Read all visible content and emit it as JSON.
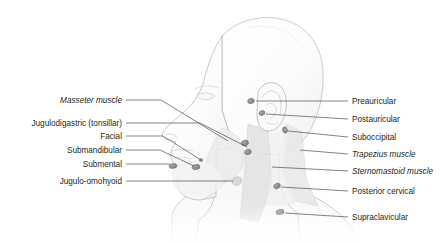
{
  "figure": {
    "background_color": "#ffffff",
    "outline_color": "#a8a8a8",
    "skin_fill": "#fbfbfb",
    "shade_fill": "#ececec",
    "muscle_fill": "#e2e2e2",
    "node_fill": "#8c8c8c",
    "leader_color": "#4d4d4d",
    "text_color": "#231f20"
  },
  "labels_left": [
    {
      "text": "Masseter muscle",
      "style": "italic",
      "x_right": 122,
      "y": 101,
      "leader": {
        "x1": 126,
        "y1": 100,
        "x2": 161,
        "y2": 100,
        "x3": 228,
        "y3": 141
      }
    },
    {
      "text": "Jugulodigastric (tonsillar)",
      "style": "normal",
      "x_right": 122,
      "y": 124,
      "leader": {
        "x1": 126,
        "y1": 123,
        "x2": 200,
        "y2": 123,
        "x3": 247,
        "y3": 105
      }
    },
    {
      "text": "Facial",
      "style": "normal",
      "x_right": 122,
      "y": 137,
      "leader": {
        "x1": 126,
        "y1": 136,
        "x2": 163,
        "y2": 136,
        "x3": 201,
        "y3": 160
      }
    },
    {
      "text": "Submandibular",
      "style": "normal",
      "x_right": 122,
      "y": 151,
      "leader": {
        "x1": 126,
        "y1": 150,
        "x2": 160,
        "y2": 150,
        "x3": 196,
        "y3": 165
      }
    },
    {
      "text": "Submental",
      "style": "normal",
      "x_right": 122,
      "y": 165,
      "leader": {
        "x1": 126,
        "y1": 164,
        "x2": 176,
        "y2": 164,
        "x3": 176,
        "y3": 164
      }
    },
    {
      "text": "Jugulo-omohyoid",
      "style": "normal",
      "x_right": 122,
      "y": 182,
      "leader": {
        "x1": 126,
        "y1": 181,
        "x2": 236,
        "y2": 181,
        "x3": 236,
        "y3": 181
      }
    }
  ],
  "labels_right": [
    {
      "text": "Preauricular",
      "style": "normal",
      "x_left": 352,
      "y": 102,
      "leader": {
        "x1": 348,
        "y1": 101,
        "x2": 258,
        "y2": 101
      }
    },
    {
      "text": "Postauricular",
      "style": "normal",
      "x_left": 352,
      "y": 120,
      "leader": {
        "x1": 348,
        "y1": 119,
        "x2": 265,
        "y2": 113
      }
    },
    {
      "text": "Suboccipital",
      "style": "normal",
      "x_left": 352,
      "y": 138,
      "leader": {
        "x1": 348,
        "y1": 137,
        "x2": 286,
        "y2": 130
      }
    },
    {
      "text": "Trapezius muscle",
      "style": "italic",
      "x_left": 352,
      "y": 155,
      "leader": {
        "x1": 348,
        "y1": 154,
        "x2": 299,
        "y2": 150
      }
    },
    {
      "text": "Sternomastoid muscle",
      "style": "italic",
      "x_left": 352,
      "y": 172,
      "leader": {
        "x1": 348,
        "y1": 171,
        "x2": 271,
        "y2": 167
      }
    },
    {
      "text": "Posterior cervical",
      "style": "normal",
      "x_left": 352,
      "y": 192,
      "leader": {
        "x1": 348,
        "y1": 191,
        "x2": 278,
        "y2": 186
      }
    },
    {
      "text": "Supraclavicular",
      "style": "normal",
      "x_left": 352,
      "y": 218,
      "leader": {
        "x1": 348,
        "y1": 217,
        "x2": 281,
        "y2": 212
      }
    }
  ],
  "nodes": [
    {
      "name": "preauricular-node",
      "cx": 251,
      "cy": 101,
      "rx": 3.4,
      "ry": 2.6,
      "rot": -18
    },
    {
      "name": "postauricular-node",
      "cx": 262,
      "cy": 113,
      "rx": 3.0,
      "ry": 2.3,
      "rot": -20
    },
    {
      "name": "suboccipital-node",
      "cx": 285,
      "cy": 130,
      "rx": 3.2,
      "ry": 2.4,
      "rot": 70
    },
    {
      "name": "jugulodigastric-node",
      "cx": 245,
      "cy": 143,
      "rx": 3.6,
      "ry": 2.8,
      "rot": -15
    },
    {
      "name": "jugulodigastric-node-lower",
      "cx": 248,
      "cy": 152,
      "rx": 3.4,
      "ry": 2.6,
      "rot": -15
    },
    {
      "name": "facial-node",
      "cx": 201,
      "cy": 160,
      "rx": 1.8,
      "ry": 1.6,
      "rot": 0
    },
    {
      "name": "submandibular-node",
      "cx": 196,
      "cy": 167,
      "rx": 4.0,
      "ry": 2.6,
      "rot": -12
    },
    {
      "name": "submental-node",
      "cx": 173,
      "cy": 166,
      "rx": 4.0,
      "ry": 2.4,
      "rot": -8
    },
    {
      "name": "jugulo-omohyoid-node",
      "cx": 237,
      "cy": 181,
      "rx": 5.0,
      "ry": 4.2,
      "rot": -25
    },
    {
      "name": "posterior-cervical-node",
      "cx": 277,
      "cy": 186,
      "rx": 3.4,
      "ry": 2.6,
      "rot": -25
    },
    {
      "name": "supraclavicular-node",
      "cx": 280,
      "cy": 212,
      "rx": 4.2,
      "ry": 2.6,
      "rot": -12
    }
  ]
}
